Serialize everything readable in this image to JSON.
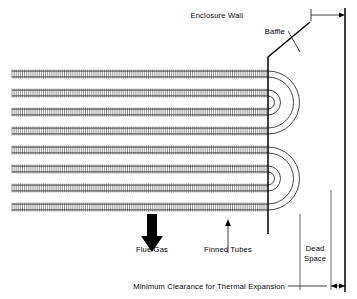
{
  "diagram": {
    "type": "engineering-cross-section",
    "width": 357,
    "height": 299,
    "background_color": "#ffffff",
    "line_color": "#000000"
  },
  "labels": {
    "enclosure_wall": "Enclosure Wall",
    "baffle": "Baffle",
    "flue_gas": "Flue Gas",
    "finned_tubes": "Finned Tubes",
    "dead_space_line1": "Dead",
    "dead_space_line2": "Space",
    "minimum_clearance": "Minimum Clearance for Thermal Expansion"
  },
  "icons": {
    "flue_gas_arrow": "thick-down-arrow-icon",
    "finned_tubes_leader": "up-arrow-leader-icon",
    "enclosure_wall_leader": "right-arrow-leader-icon",
    "baffle_leader": "diagonal-leader-icon",
    "clearance_dimension": "double-headed-arrow-icon"
  },
  "geometry": {
    "tube_rows": 8,
    "tube_row_y": [
      74,
      93,
      112,
      131,
      150,
      169,
      188,
      207
    ],
    "tube_left_x": 12,
    "tube_right_x": 268,
    "tube_band_height": 9,
    "fin_spacing": 2.1,
    "baffle_vertical_x": 268,
    "baffle_top_y": 57,
    "baffle_diagonal_end_x": 310,
    "baffle_diagonal_end_y": 22,
    "enclosure_wall_x": 345,
    "enclosure_wall_top_y": 8,
    "enclosure_wall_bottom_y": 292,
    "dead_space_left_x": 300,
    "dead_space_right_x": 331,
    "bend_group_1_center_y": 112,
    "bend_group_2_center_y": 188,
    "bend_radii": [
      9.5,
      19,
      28.5,
      38
    ],
    "clearance_dim_y": 286,
    "clearance_left_x": 331,
    "clearance_right_x": 345
  },
  "colors": {
    "stroke": "#000000",
    "tube": "#222222",
    "fin": "#3a3a3a",
    "dimension": "#2b2b2b",
    "arrow_fill": "#000000"
  }
}
